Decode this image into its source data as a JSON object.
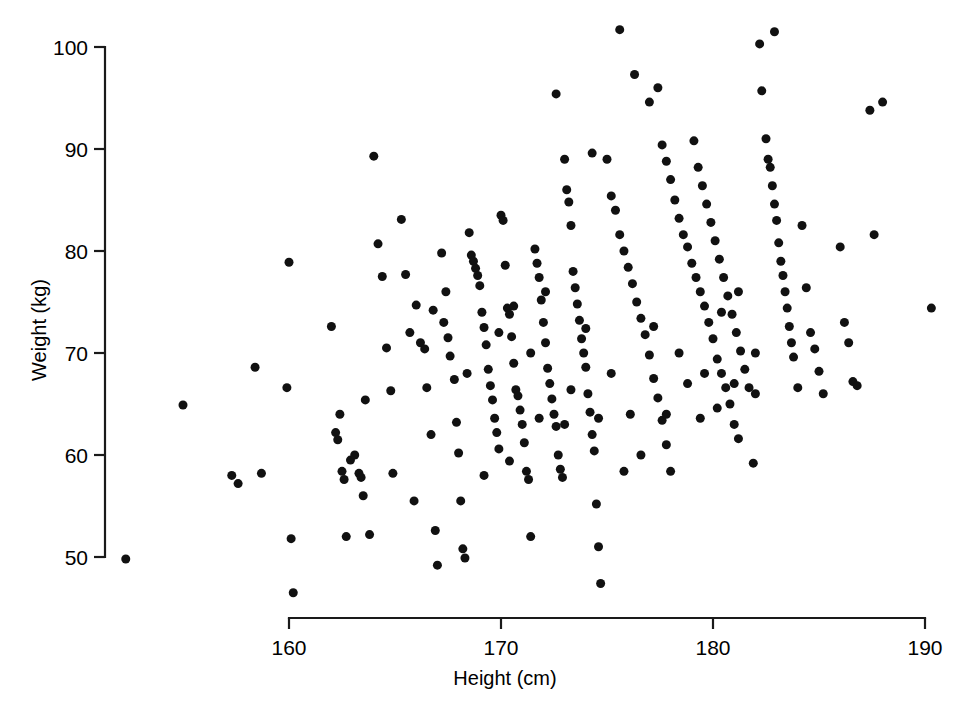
{
  "chart_data": {
    "type": "scatter",
    "title": "",
    "xlabel": "Height (cm)",
    "ylabel": "Weight (kg)",
    "xlim": [
      150,
      192
    ],
    "ylim": [
      45,
      103
    ],
    "xticks": [
      160,
      170,
      180,
      190
    ],
    "yticks": [
      50,
      60,
      70,
      80,
      90,
      100
    ],
    "xtick_labels": [
      "160",
      "170",
      "180",
      "190"
    ],
    "ytick_labels": [
      "50",
      "60",
      "70",
      "80",
      "90",
      "100"
    ],
    "grid": false,
    "legend": null,
    "marker": "filled-circle",
    "marker_color": "#111111",
    "marker_size_px": 9,
    "n_points": 310,
    "points": [
      [
        152.3,
        49.8
      ],
      [
        155.0,
        64.9
      ],
      [
        157.3,
        58.0
      ],
      [
        157.6,
        57.2
      ],
      [
        158.4,
        68.6
      ],
      [
        158.7,
        58.2
      ],
      [
        159.9,
        66.6
      ],
      [
        160.0,
        78.9
      ],
      [
        160.1,
        51.8
      ],
      [
        160.2,
        46.5
      ],
      [
        162.0,
        72.6
      ],
      [
        162.2,
        62.2
      ],
      [
        162.3,
        61.5
      ],
      [
        162.4,
        64.0
      ],
      [
        162.5,
        58.4
      ],
      [
        162.6,
        57.6
      ],
      [
        162.7,
        52.0
      ],
      [
        162.9,
        59.5
      ],
      [
        163.1,
        60.0
      ],
      [
        163.3,
        58.2
      ],
      [
        163.4,
        57.8
      ],
      [
        163.5,
        56.0
      ],
      [
        163.6,
        65.4
      ],
      [
        163.8,
        52.2
      ],
      [
        164.0,
        89.3
      ],
      [
        164.2,
        80.7
      ],
      [
        164.4,
        77.5
      ],
      [
        164.6,
        70.5
      ],
      [
        164.8,
        66.3
      ],
      [
        164.9,
        58.2
      ],
      [
        165.3,
        83.1
      ],
      [
        165.5,
        77.7
      ],
      [
        165.7,
        72.0
      ],
      [
        165.9,
        55.5
      ],
      [
        166.0,
        74.7
      ],
      [
        166.2,
        71.0
      ],
      [
        166.4,
        70.4
      ],
      [
        166.5,
        66.6
      ],
      [
        166.7,
        62.0
      ],
      [
        166.9,
        52.6
      ],
      [
        167.0,
        49.2
      ],
      [
        167.2,
        79.8
      ],
      [
        167.4,
        76.0
      ],
      [
        167.5,
        71.5
      ],
      [
        167.6,
        69.7
      ],
      [
        167.8,
        67.4
      ],
      [
        167.9,
        63.2
      ],
      [
        168.0,
        60.2
      ],
      [
        168.1,
        55.5
      ],
      [
        168.2,
        50.8
      ],
      [
        168.3,
        49.9
      ],
      [
        168.5,
        81.8
      ],
      [
        168.6,
        79.6
      ],
      [
        168.7,
        79.0
      ],
      [
        168.8,
        78.3
      ],
      [
        168.9,
        77.6
      ],
      [
        169.0,
        76.6
      ],
      [
        169.1,
        74.0
      ],
      [
        169.2,
        72.5
      ],
      [
        169.3,
        70.8
      ],
      [
        169.4,
        68.4
      ],
      [
        169.5,
        66.8
      ],
      [
        169.6,
        65.4
      ],
      [
        169.7,
        63.6
      ],
      [
        169.8,
        62.2
      ],
      [
        169.9,
        60.6
      ],
      [
        170.0,
        83.5
      ],
      [
        170.1,
        83.0
      ],
      [
        170.2,
        78.6
      ],
      [
        170.3,
        74.4
      ],
      [
        170.4,
        73.8
      ],
      [
        170.5,
        71.6
      ],
      [
        170.6,
        69.0
      ],
      [
        170.7,
        66.4
      ],
      [
        170.8,
        65.8
      ],
      [
        170.9,
        64.4
      ],
      [
        171.0,
        63.0
      ],
      [
        171.1,
        61.2
      ],
      [
        171.2,
        58.4
      ],
      [
        171.3,
        57.6
      ],
      [
        171.4,
        52.0
      ],
      [
        171.6,
        80.2
      ],
      [
        171.7,
        78.8
      ],
      [
        171.8,
        77.4
      ],
      [
        171.9,
        75.2
      ],
      [
        172.0,
        73.0
      ],
      [
        172.1,
        71.0
      ],
      [
        172.2,
        68.5
      ],
      [
        172.3,
        67.0
      ],
      [
        172.4,
        65.5
      ],
      [
        172.5,
        64.0
      ],
      [
        172.6,
        62.8
      ],
      [
        172.7,
        60.0
      ],
      [
        172.8,
        58.6
      ],
      [
        172.9,
        57.8
      ],
      [
        173.0,
        89.0
      ],
      [
        173.1,
        86.0
      ],
      [
        173.2,
        84.8
      ],
      [
        173.3,
        82.5
      ],
      [
        173.4,
        78.0
      ],
      [
        173.5,
        76.4
      ],
      [
        173.6,
        74.8
      ],
      [
        173.7,
        73.2
      ],
      [
        173.8,
        71.4
      ],
      [
        173.9,
        70.0
      ],
      [
        174.0,
        68.6
      ],
      [
        174.1,
        66.0
      ],
      [
        174.2,
        64.2
      ],
      [
        174.3,
        62.0
      ],
      [
        174.4,
        60.4
      ],
      [
        174.5,
        55.2
      ],
      [
        174.6,
        51.0
      ],
      [
        174.7,
        47.4
      ],
      [
        172.6,
        95.4
      ],
      [
        174.3,
        89.6
      ],
      [
        175.0,
        89.0
      ],
      [
        175.2,
        85.4
      ],
      [
        175.4,
        84.0
      ],
      [
        175.6,
        81.6
      ],
      [
        175.8,
        80.0
      ],
      [
        176.0,
        78.4
      ],
      [
        176.2,
        76.8
      ],
      [
        176.4,
        75.0
      ],
      [
        176.6,
        73.4
      ],
      [
        176.8,
        71.8
      ],
      [
        177.0,
        69.8
      ],
      [
        177.2,
        67.5
      ],
      [
        177.4,
        65.6
      ],
      [
        177.6,
        63.4
      ],
      [
        177.8,
        61.0
      ],
      [
        178.0,
        58.4
      ],
      [
        175.6,
        101.7
      ],
      [
        176.3,
        97.3
      ],
      [
        177.0,
        94.6
      ],
      [
        177.4,
        96.0
      ],
      [
        177.6,
        90.4
      ],
      [
        177.8,
        88.8
      ],
      [
        178.0,
        87.0
      ],
      [
        178.2,
        85.0
      ],
      [
        178.4,
        83.2
      ],
      [
        178.6,
        81.6
      ],
      [
        178.8,
        80.4
      ],
      [
        179.0,
        78.8
      ],
      [
        179.2,
        77.4
      ],
      [
        179.4,
        76.0
      ],
      [
        179.6,
        74.6
      ],
      [
        179.8,
        73.0
      ],
      [
        180.0,
        71.4
      ],
      [
        180.2,
        69.4
      ],
      [
        180.4,
        68.0
      ],
      [
        180.6,
        66.6
      ],
      [
        180.8,
        65.0
      ],
      [
        181.0,
        63.0
      ],
      [
        181.2,
        61.6
      ],
      [
        179.1,
        90.8
      ],
      [
        179.3,
        88.2
      ],
      [
        179.5,
        86.4
      ],
      [
        179.7,
        84.6
      ],
      [
        179.9,
        82.8
      ],
      [
        180.1,
        81.0
      ],
      [
        180.3,
        79.2
      ],
      [
        180.5,
        77.4
      ],
      [
        180.7,
        75.6
      ],
      [
        180.9,
        73.8
      ],
      [
        181.1,
        72.0
      ],
      [
        181.3,
        70.2
      ],
      [
        181.5,
        68.4
      ],
      [
        181.7,
        66.6
      ],
      [
        181.9,
        59.2
      ],
      [
        182.2,
        100.3
      ],
      [
        182.3,
        95.7
      ],
      [
        182.5,
        91.0
      ],
      [
        182.6,
        89.0
      ],
      [
        182.7,
        88.2
      ],
      [
        182.8,
        86.4
      ],
      [
        182.9,
        84.6
      ],
      [
        183.0,
        83.0
      ],
      [
        183.1,
        80.8
      ],
      [
        183.2,
        79.0
      ],
      [
        183.3,
        77.6
      ],
      [
        183.4,
        76.0
      ],
      [
        183.5,
        74.4
      ],
      [
        183.6,
        72.6
      ],
      [
        183.7,
        71.0
      ],
      [
        183.8,
        69.6
      ],
      [
        184.0,
        66.6
      ],
      [
        182.9,
        101.5
      ],
      [
        184.2,
        82.5
      ],
      [
        184.4,
        76.4
      ],
      [
        184.6,
        72.0
      ],
      [
        184.8,
        70.4
      ],
      [
        185.0,
        68.2
      ],
      [
        185.2,
        66.0
      ],
      [
        186.0,
        80.4
      ],
      [
        186.2,
        73.0
      ],
      [
        186.4,
        71.0
      ],
      [
        186.6,
        67.2
      ],
      [
        186.8,
        66.8
      ],
      [
        187.4,
        93.8
      ],
      [
        187.6,
        81.6
      ],
      [
        188.0,
        94.6
      ],
      [
        190.3,
        74.4
      ],
      [
        166.8,
        74.2
      ],
      [
        167.3,
        73.0
      ],
      [
        169.9,
        72.0
      ],
      [
        170.6,
        74.6
      ],
      [
        171.4,
        70.0
      ],
      [
        172.1,
        76.0
      ],
      [
        173.3,
        66.4
      ],
      [
        174.0,
        72.4
      ],
      [
        175.2,
        68.0
      ],
      [
        176.1,
        64.0
      ],
      [
        177.2,
        72.6
      ],
      [
        178.4,
        70.0
      ],
      [
        179.6,
        68.0
      ],
      [
        180.4,
        74.0
      ],
      [
        181.2,
        76.0
      ],
      [
        182.0,
        70.0
      ],
      [
        168.4,
        68.0
      ],
      [
        169.2,
        58.0
      ],
      [
        170.4,
        59.4
      ],
      [
        171.8,
        63.6
      ],
      [
        173.0,
        63.0
      ],
      [
        174.6,
        63.6
      ],
      [
        175.8,
        58.4
      ],
      [
        176.6,
        60.0
      ],
      [
        177.8,
        64.0
      ],
      [
        178.8,
        67.0
      ],
      [
        179.4,
        63.6
      ],
      [
        180.2,
        64.6
      ],
      [
        181.0,
        67.0
      ],
      [
        182.0,
        66.0
      ]
    ]
  },
  "axis": {
    "x_axis_name": "x-axis",
    "y_axis_name": "y-axis"
  }
}
